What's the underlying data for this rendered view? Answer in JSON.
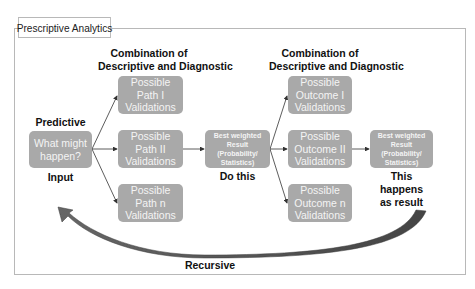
{
  "title": "Prescriptive Analytics",
  "columns": [
    {
      "header": [
        "Combination of",
        "Descriptive and Diagnostic"
      ]
    },
    {
      "header": [
        "Combination of",
        "Descriptive and Diagnostic"
      ]
    }
  ],
  "input_node": {
    "top_label": "Predictive",
    "lines": [
      "What might",
      "happen?"
    ],
    "bottom_label": "Input"
  },
  "paths": [
    {
      "lines": [
        "Possible",
        "Path I",
        "Validations"
      ]
    },
    {
      "lines": [
        "Possible",
        "Path II",
        "Validations"
      ]
    },
    {
      "lines": [
        "Possible",
        "Path n",
        "Validations"
      ]
    }
  ],
  "result_1": {
    "lines": [
      "Best weighted",
      "Result",
      "(Probability/",
      "Statistics)"
    ],
    "bottom_label": "Do this"
  },
  "outcomes": [
    {
      "lines": [
        "Possible",
        "Outcome I",
        "Validations"
      ]
    },
    {
      "lines": [
        "Possible",
        "Outcome II",
        "Validations"
      ]
    },
    {
      "lines": [
        "Possible",
        "Outcome n",
        "Validations"
      ]
    }
  ],
  "result_2": {
    "lines": [
      "Best weighted",
      "Result",
      "(Probability/",
      "Statistics)"
    ],
    "bottom_label": [
      "This",
      "happens",
      "as result"
    ]
  },
  "loop": {
    "label": "Recursive"
  },
  "colors": {
    "box_fill": "#a9a9a9",
    "box_text": "#f4f4f4",
    "frame": "#b8b8b8",
    "arrow": "#333333",
    "loop_arrow": "#555555"
  }
}
